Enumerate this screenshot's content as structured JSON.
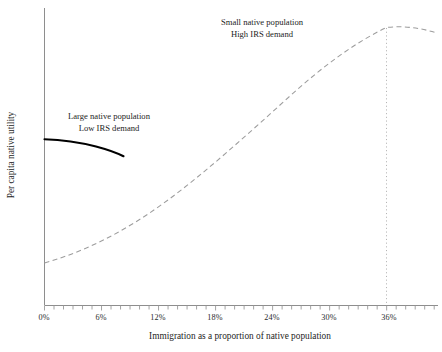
{
  "chart_data": {
    "type": "line",
    "title": "",
    "xlabel": "Immigration as a proportion of native population",
    "ylabel": "Per capita native utility",
    "xlim": [
      0,
      41.4
    ],
    "ylim": [
      0,
      1
    ],
    "grid": false,
    "legend_position": "inline-annotations",
    "x_tick_labels": [
      "0%",
      "6%",
      "12%",
      "18%",
      "24%",
      "30%",
      "36%"
    ],
    "x_tick_values": [
      0,
      6,
      12,
      18,
      24,
      30,
      36
    ],
    "x_minor_tick_interval": 1,
    "y_tick_labels": [],
    "series": [
      {
        "name": "Large native population / Low IRS demand",
        "style": "solid",
        "color": "#000000",
        "x": [
          0,
          1,
          2,
          3,
          4,
          5,
          6,
          7,
          8.3
        ],
        "y": [
          0.598,
          0.597,
          0.594,
          0.589,
          0.581,
          0.571,
          0.558,
          0.542,
          0.52
        ]
      },
      {
        "name": "Small native population / High IRS demand",
        "style": "dashed",
        "color": "#9d9d9d",
        "x": [
          0,
          3,
          6,
          9,
          12,
          15,
          18,
          21,
          24,
          27,
          30,
          33,
          36,
          38,
          41.4
        ],
        "y": [
          0.142,
          0.206,
          0.27,
          0.336,
          0.404,
          0.47,
          0.546,
          0.62,
          0.7,
          0.778,
          0.848,
          0.9,
          0.936,
          0.934,
          0.918
        ]
      }
    ],
    "annotations": [
      {
        "name": "small-native-population-annotation",
        "line1": "Small native population",
        "line2": "High IRS demand",
        "x": 27.5,
        "y": 0.955
      },
      {
        "name": "large-native-population-annotation",
        "line1": "Large native population",
        "line2": "Low IRS demand",
        "x": 10.2,
        "y": 0.645
      }
    ],
    "reference_lines": [
      {
        "name": "optimal-immigration-guide",
        "orientation": "vertical",
        "x": 36,
        "style": "dotted",
        "color": "#b4b4b4"
      }
    ]
  },
  "axis_titles": {
    "x": "Immigration as a proportion of native population",
    "y": "Per capita native utility"
  }
}
